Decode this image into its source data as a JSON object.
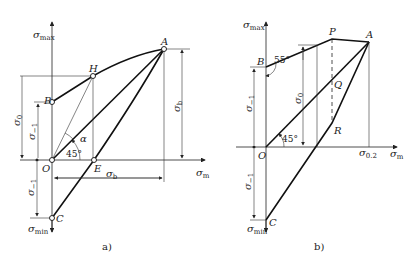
{
  "figure_a": {
    "caption": "a)",
    "axis_y": "σ",
    "axis_y_sub": "max",
    "axis_x": "σ",
    "axis_x_sub": "m",
    "axis_y_neg": "σ",
    "axis_y_neg_sub": "min",
    "points": {
      "A": "A",
      "H": "H",
      "B": "B",
      "O": "O",
      "E": "E",
      "C": "C"
    },
    "dims": {
      "sigma0": "σ",
      "sigma0_sub": "0",
      "sigma_m1": "σ",
      "sigma_m1_sub": "−1",
      "sigma_b_v": "σ",
      "sigma_b_v_sub": "b",
      "sigma_b_h": "σ",
      "sigma_b_h_sub": "b",
      "sigma_m1_neg": "σ",
      "sigma_m1_neg_sub": "−1"
    },
    "angles": {
      "a45": "45°",
      "alpha": "α"
    }
  },
  "figure_b": {
    "caption": "b)",
    "axis_y": "σ",
    "axis_y_sub": "max",
    "axis_x": "σ",
    "axis_x_sub": "m",
    "axis_y_neg": "σ",
    "axis_y_neg_sub": "min",
    "points": {
      "A": "A",
      "P": "P",
      "B": "B",
      "Q": "Q",
      "R": "R",
      "O": "O",
      "C": "C"
    },
    "dims": {
      "sigma0": "σ",
      "sigma0_sub": "0",
      "sigma_m1": "σ",
      "sigma_m1_sub": "−1",
      "sigma_m1_neg": "σ",
      "sigma_m1_neg_sub": "−1",
      "sigma02": "σ",
      "sigma02_sub": "0.2"
    },
    "angles": {
      "a55": "55°",
      "a45": "45°"
    }
  }
}
